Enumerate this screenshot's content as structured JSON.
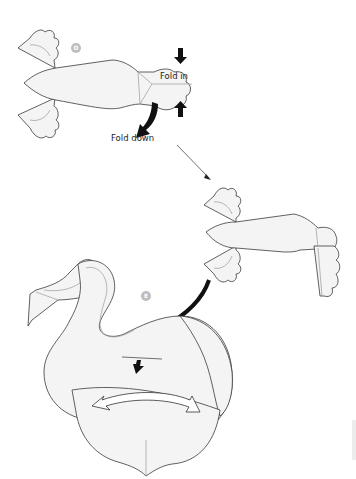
{
  "diagram": {
    "steps": [
      {
        "id": "D",
        "badge": "D",
        "labels": {
          "fold_in": "Fold in",
          "fold_down": "Fold down"
        }
      },
      {
        "id": "intermediate",
        "badge": ""
      },
      {
        "id": "E",
        "badge": "E"
      }
    ],
    "colors": {
      "paper_fill": "#f4f4f4",
      "outline": "#3a3a3a",
      "crease": "#9a9a9a",
      "badge": "#bdbdbd",
      "arrow": "#111111"
    }
  }
}
